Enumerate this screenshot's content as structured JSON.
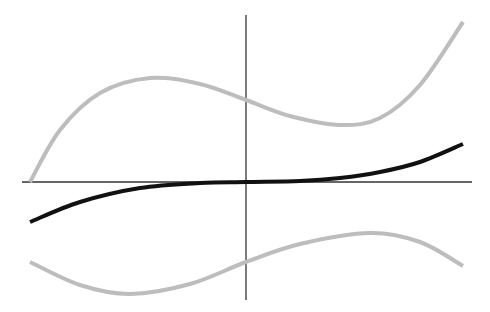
{
  "chart_data": {
    "type": "line",
    "title": "",
    "xlabel": "",
    "ylabel": "",
    "grid": false,
    "legend": null,
    "axes": {
      "x_axis": {
        "y_px": 182,
        "x_start_px": 22,
        "x_end_px": 472,
        "color": "#333333"
      },
      "y_axis": {
        "x_px": 246,
        "y_start_px": 15,
        "y_end_px": 300,
        "color": "#333333"
      }
    },
    "series": [
      {
        "name": "upper-band",
        "color": "#bdbdbd",
        "width": 4,
        "points_px": [
          [
            30,
            182
          ],
          [
            60,
            130
          ],
          [
            100,
            93
          ],
          [
            150,
            78
          ],
          [
            200,
            84
          ],
          [
            246,
            100
          ],
          [
            290,
            116
          ],
          [
            340,
            125
          ],
          [
            380,
            118
          ],
          [
            420,
            85
          ],
          [
            463,
            22
          ]
        ]
      },
      {
        "name": "mean-curve",
        "color": "#111111",
        "width": 4,
        "points_px": [
          [
            30,
            222
          ],
          [
            80,
            202
          ],
          [
            140,
            188
          ],
          [
            200,
            183
          ],
          [
            246,
            182
          ],
          [
            300,
            181
          ],
          [
            340,
            178
          ],
          [
            380,
            172
          ],
          [
            420,
            162
          ],
          [
            463,
            144
          ]
        ]
      },
      {
        "name": "lower-band",
        "color": "#bdbdbd",
        "width": 4,
        "points_px": [
          [
            30,
            262
          ],
          [
            80,
            285
          ],
          [
            130,
            294
          ],
          [
            190,
            284
          ],
          [
            246,
            262
          ],
          [
            300,
            244
          ],
          [
            370,
            233
          ],
          [
            420,
            242
          ],
          [
            463,
            266
          ]
        ]
      }
    ]
  }
}
